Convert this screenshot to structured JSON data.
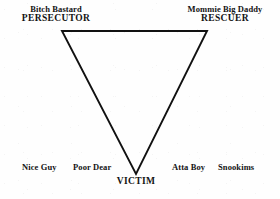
{
  "diagram": {
    "shape": "inverted-triangle",
    "stroke_color": "#111111",
    "background_color": "#fefefe",
    "vertices": [
      {
        "id": "persecutor",
        "x": 62,
        "y": 31
      },
      {
        "id": "rescuer",
        "x": 207,
        "y": 31
      },
      {
        "id": "victim",
        "x": 136,
        "y": 174
      }
    ],
    "corners": [
      {
        "id": "persecutor",
        "role": "PERSECUTOR",
        "aliases": "Bitch  Bastard",
        "position": "top-left"
      },
      {
        "id": "rescuer",
        "role": "RESCUER",
        "aliases": "Mommie  Big Daddy",
        "position": "top-right"
      },
      {
        "id": "victim",
        "role": "VICTIM",
        "aliases": "",
        "position": "bottom-center"
      }
    ],
    "outcomes": [
      {
        "id": "nice-guy",
        "label": "Nice Guy",
        "x": 22,
        "y": 163
      },
      {
        "id": "poor-dear",
        "label": "Poor Dear",
        "x": 73,
        "y": 163
      },
      {
        "id": "atta-boy",
        "label": "Atta Boy",
        "x": 172,
        "y": 163
      },
      {
        "id": "snookims",
        "label": "Snookims",
        "x": 218,
        "y": 163
      }
    ]
  }
}
